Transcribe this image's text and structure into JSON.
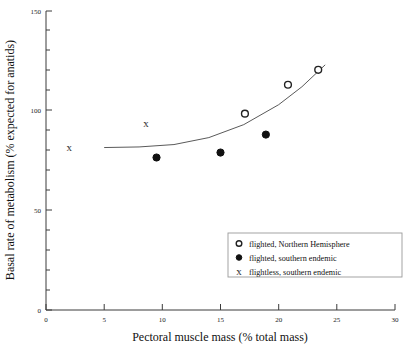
{
  "chart_data": {
    "type": "scatter",
    "title": "",
    "xlabel": "Pectoral muscle mass (% total mass)",
    "ylabel": "Basal rate of metabolism (% expected for anatids)",
    "xlim": [
      0,
      30
    ],
    "ylim": [
      0,
      150
    ],
    "xticks": [
      0,
      5,
      10,
      15,
      20,
      25,
      30
    ],
    "xtick_labels": [
      "0",
      "5",
      "10",
      "15",
      "20",
      "25",
      "30"
    ],
    "yticks": [
      0,
      50,
      100,
      150
    ],
    "ytick_labels": [
      "0",
      "50",
      "100",
      "150"
    ],
    "yminor_ticks": [
      10,
      20,
      30,
      40,
      60,
      70,
      80,
      90,
      110,
      120,
      130,
      140
    ],
    "grid": false,
    "legend_position": "lower right",
    "series": [
      {
        "name": "flighted, Northern Hemisphere",
        "marker": "open-circle",
        "color": "#222222",
        "points": [
          {
            "x": 17.1,
            "y": 98.5
          },
          {
            "x": 20.8,
            "y": 113.0
          },
          {
            "x": 23.4,
            "y": 120.5
          }
        ]
      },
      {
        "name": "flighted, southern endemic",
        "marker": "filled-circle",
        "color": "#111111",
        "points": [
          {
            "x": 9.5,
            "y": 76.5
          },
          {
            "x": 15.0,
            "y": 79.0
          },
          {
            "x": 18.9,
            "y": 88.0
          }
        ]
      },
      {
        "name": "flightless, southern endemic",
        "marker": "x",
        "color": "#333333",
        "points": [
          {
            "x": 2.0,
            "y": 82.0
          },
          {
            "x": 8.6,
            "y": 94.0
          }
        ]
      }
    ],
    "fit_curve": {
      "name": "fitted trend",
      "color": "#5a5a5a",
      "points": [
        {
          "x": 5.0,
          "y": 81.5
        },
        {
          "x": 8.0,
          "y": 81.8
        },
        {
          "x": 11.0,
          "y": 83.0
        },
        {
          "x": 14.0,
          "y": 86.5
        },
        {
          "x": 17.0,
          "y": 93.0
        },
        {
          "x": 20.0,
          "y": 103.0
        },
        {
          "x": 22.0,
          "y": 112.0
        },
        {
          "x": 24.0,
          "y": 123.0
        }
      ]
    },
    "legend_entries": [
      {
        "marker": "open-circle",
        "label": "flighted, Northern Hemisphere"
      },
      {
        "marker": "filled-circle",
        "label": "flighted, southern endemic"
      },
      {
        "marker": "x",
        "label": "flightless, southern endemic"
      }
    ]
  }
}
